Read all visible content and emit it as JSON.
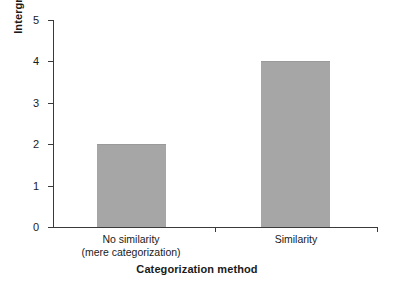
{
  "chart_data": {
    "type": "bar",
    "title": "",
    "xlabel": "Categorization method",
    "ylabel": "Intergroup bias",
    "categories": [
      "No similarity\n(mere categorization)",
      "Similarity"
    ],
    "category_lines": [
      [
        "No similarity",
        "(mere categorization)"
      ],
      [
        "Similarity",
        ""
      ]
    ],
    "values": [
      2,
      4
    ],
    "ylim": [
      0,
      5
    ],
    "yticks": [
      0,
      1,
      2,
      3,
      4,
      5
    ],
    "ytick_labels": [
      "0",
      "1",
      "2",
      "3",
      "4",
      "5"
    ],
    "grid": false,
    "legend": false,
    "bar_color": "#a6a6a6",
    "axis_color": "#3a3a3a",
    "background": "#ffffff"
  }
}
